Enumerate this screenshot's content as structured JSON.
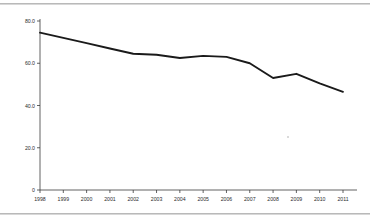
{
  "figure": {
    "background_color": "#ffffff",
    "line_color": "#1a1a1a",
    "axis_color": "#3a3a3a",
    "rule_color": "#b9b9b9",
    "has_top_rule": true,
    "has_bottom_rule": true
  },
  "chart_data": {
    "type": "line",
    "title": "",
    "subtitle": "",
    "xlabel": "",
    "ylabel": "",
    "x": [
      1998,
      1999,
      2000,
      2001,
      2002,
      2003,
      2004,
      2005,
      2006,
      2007,
      2008,
      2009,
      2010,
      2011
    ],
    "categories": [
      "1998",
      "1999",
      "2000",
      "2001",
      "2002",
      "2003",
      "2004",
      "2005",
      "2006",
      "2007",
      "2008",
      "2009",
      "2010",
      "2011"
    ],
    "values": [
      74.5,
      72.0,
      69.5,
      67.0,
      64.5,
      64.0,
      62.5,
      63.5,
      63.0,
      60.0,
      53.0,
      55.0,
      50.5,
      46.5
    ],
    "series": [
      {
        "name": "series-1",
        "values": [
          74.5,
          72.0,
          69.5,
          67.0,
          64.5,
          64.0,
          62.5,
          63.5,
          63.0,
          60.0,
          53.0,
          55.0,
          50.5,
          46.5
        ]
      }
    ],
    "xlim": [
      1998,
      2011
    ],
    "ylim": [
      0,
      80
    ],
    "ytick_values": [
      0,
      20,
      40,
      60,
      80
    ],
    "ytick_labels": [
      "0",
      "20.0",
      "40.0",
      "60.0",
      "80.0"
    ],
    "xtick_labels": [
      "1998",
      "1999",
      "2000",
      "2001",
      "2002",
      "2003",
      "2004",
      "2005",
      "2006",
      "2007",
      "2008",
      "2009",
      "2010",
      "2011"
    ],
    "grid": false,
    "legend": false,
    "legend_position": "none",
    "annotations": []
  }
}
